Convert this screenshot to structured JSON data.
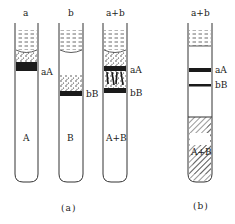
{
  "figure": {
    "panel_a": {
      "caption": "(a)",
      "tubes": [
        {
          "id": "a",
          "top_label": "a",
          "band_labels": [
            "aA"
          ],
          "bottom_label": "A"
        },
        {
          "id": "b",
          "top_label": "b",
          "band_labels": [
            "bB"
          ],
          "bottom_label": "B"
        },
        {
          "id": "a+b",
          "top_label": "a+b",
          "band_labels": [
            "aA",
            "bB"
          ],
          "bottom_label": "A+B"
        }
      ]
    },
    "panel_b": {
      "caption": "(b)",
      "tubes": [
        {
          "id": "a+b",
          "top_label": "a+b",
          "band_labels": [
            "aA",
            "bB"
          ],
          "bottom_label": "A+B"
        }
      ]
    }
  },
  "colors": {
    "ink": "#1a1a1a",
    "background": "#ffffff"
  }
}
